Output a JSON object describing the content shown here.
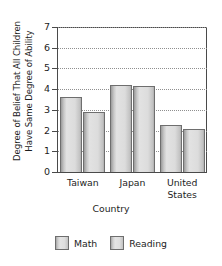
{
  "chart_data": {
    "type": "bar",
    "title": "",
    "xlabel": "Country",
    "ylabel": "Degree of Belief That All Children Have Same Degree of Ability",
    "ylabel_lines": [
      "Degree of Belief That All Children",
      "Have Same Degree of Ability"
    ],
    "categories": [
      "Taiwan",
      "Japan",
      "United States"
    ],
    "category_lines": [
      [
        "Taiwan"
      ],
      [
        "Japan"
      ],
      [
        "United",
        "States"
      ]
    ],
    "series": [
      {
        "name": "Math",
        "values": [
          3.6,
          4.2,
          2.25
        ]
      },
      {
        "name": "Reading",
        "values": [
          2.9,
          4.15,
          2.1
        ]
      }
    ],
    "ylim": [
      0,
      7
    ],
    "ytick_labels": [
      "7",
      "6",
      "5",
      "4",
      "3",
      "2",
      "1",
      "0"
    ],
    "ytick_values": [
      7,
      6,
      5,
      4,
      3,
      2,
      1,
      0
    ],
    "grid": true,
    "grid_style": "dotted",
    "legend_position": "bottom",
    "colors": {
      "bar_fill_light": "#e2e2e2",
      "bar_fill_dark": "#adadad",
      "bar_border": "#6e6e6e",
      "axis": "#4a4a4a",
      "gridline": "#8f8f8f",
      "text": "#1d1d1d",
      "background": "#ffffff"
    }
  }
}
